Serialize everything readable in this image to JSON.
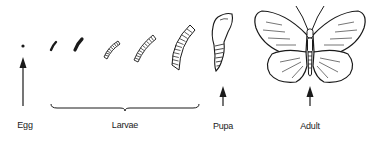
{
  "diagram": {
    "title": "",
    "type": "life-cycle",
    "stroke_color": "#1a1a1a",
    "stages": [
      {
        "id": "egg",
        "label": "Egg",
        "label_x": 25
      },
      {
        "id": "larvae",
        "label": "Larvae",
        "label_x": 125
      },
      {
        "id": "pupa",
        "label": "Pupa",
        "label_x": 223
      },
      {
        "id": "adult",
        "label": "Adult",
        "label_x": 310
      }
    ]
  }
}
